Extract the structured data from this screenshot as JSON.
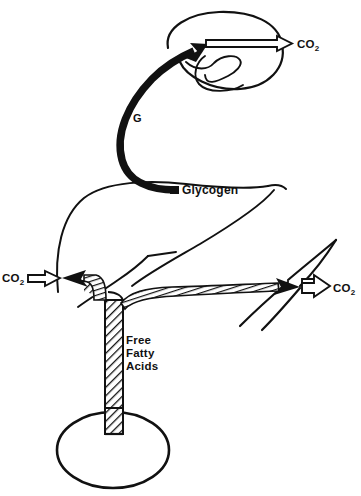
{
  "figure": {
    "background_color": "#ffffff",
    "ink_color": "#111111",
    "labels": {
      "brain_co2": "CO",
      "brain_co2_sub": "2",
      "glucose": "G",
      "glycogen": "Glycogen",
      "free_fatty_acids_line1": "Free",
      "free_fatty_acids_line2": "Fatty",
      "free_fatty_acids_line3": "Acids",
      "left_co2": "CO",
      "left_co2_sub": "2",
      "right_co2": "CO",
      "right_co2_sub": "2"
    },
    "organs": [
      {
        "name": "brain",
        "shape": "lobed-oval",
        "position": "top-center-right"
      },
      {
        "name": "liver",
        "shape": "curved-outline",
        "position": "mid-left"
      },
      {
        "name": "muscle-left",
        "shape": "tapered-outline",
        "position": "mid-left"
      },
      {
        "name": "muscle-right",
        "shape": "chevron-outline",
        "position": "mid-right"
      },
      {
        "name": "adipose-tissue",
        "shape": "ellipse",
        "position": "bottom-center-left"
      }
    ],
    "flows": [
      {
        "name": "glucose-to-brain",
        "style": "solid-black-thick-arrow",
        "from": "Glycogen",
        "to": "brain",
        "label": "G"
      },
      {
        "name": "brain-co2-output",
        "style": "hollow-outline-arrow",
        "from": "brain",
        "to": "CO2"
      },
      {
        "name": "ffa-from-adipose",
        "style": "hatched-pipe",
        "from": "Free Fatty Acids",
        "to": "muscle"
      },
      {
        "name": "ffa-to-left-muscle",
        "style": "hatched-arrow",
        "from": "Free Fatty Acids",
        "to": "muscle-left"
      },
      {
        "name": "ffa-to-right-muscle",
        "style": "hatched-arrow",
        "from": "Free Fatty Acids",
        "to": "muscle-right"
      },
      {
        "name": "left-muscle-co2-output",
        "style": "hollow-outline-arrow",
        "from": "muscle-left",
        "to": "CO2"
      },
      {
        "name": "right-muscle-co2-output",
        "style": "hollow-outline-arrow",
        "from": "muscle-right",
        "to": "CO2"
      }
    ]
  },
  "caption": {
    "text": ""
  }
}
